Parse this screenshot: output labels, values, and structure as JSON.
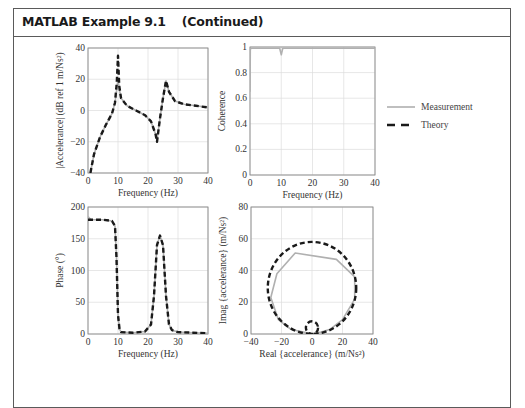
{
  "header": {
    "title": "MATLAB Example 9.1",
    "subtitle": "(Continued)"
  },
  "legend": {
    "items": [
      {
        "label": "Measurement",
        "style": "solid",
        "color": "#b0b0b0"
      },
      {
        "label": "Theory",
        "style": "dashed",
        "color": "#1a1a1a"
      }
    ]
  },
  "colors": {
    "measurement": "#b0b0b0",
    "theory": "#1a1a1a",
    "grid": "#dcdcdc",
    "axis": "#888888"
  },
  "chart_data": [
    {
      "id": "accelerance-magnitude",
      "type": "line",
      "title": "",
      "xlabel": "Frequency (Hz)",
      "ylabel": "|Accelerance| (dB ref 1 m/Ns²)",
      "xlim": [
        0,
        40
      ],
      "ylim": [
        -40,
        40
      ],
      "xticks": [
        "0",
        "10",
        "20",
        "30",
        "40"
      ],
      "yticks": [
        "-40",
        "-20",
        "0",
        "20",
        "40"
      ],
      "grid": true,
      "series": [
        {
          "name": "Measurement",
          "x": [
            0.8,
            2,
            4,
            6,
            8,
            9,
            9.6,
            10,
            10.4,
            11,
            13,
            16,
            19,
            21,
            22.5,
            23,
            24,
            25,
            26,
            27,
            29,
            32,
            36,
            40
          ],
          "y": [
            -40,
            -28,
            -17,
            -9,
            -2,
            5,
            14,
            20,
            14,
            8,
            3,
            0,
            -3,
            -7,
            -15,
            -19,
            -5,
            8,
            19,
            12,
            6,
            4,
            3,
            2
          ]
        },
        {
          "name": "Theory",
          "x": [
            0.8,
            2,
            4,
            6,
            8,
            9,
            9.6,
            10,
            10.4,
            11,
            13,
            16,
            19,
            21,
            22.5,
            23,
            24,
            25,
            26,
            27,
            29,
            32,
            36,
            40
          ],
          "y": [
            -40,
            -28,
            -17,
            -9,
            -2,
            5,
            18,
            35,
            16,
            8,
            3,
            0,
            -3,
            -7,
            -15,
            -20,
            -5,
            8,
            19,
            12,
            6,
            4,
            3,
            2
          ]
        }
      ]
    },
    {
      "id": "coherence",
      "type": "line",
      "title": "",
      "xlabel": "Frequency (Hz)",
      "ylabel": "Coherence",
      "xlim": [
        0,
        40
      ],
      "ylim": [
        0,
        1
      ],
      "xticks": [
        "0",
        "10",
        "20",
        "30",
        "40"
      ],
      "yticks": [
        "0",
        "0.2",
        "0.4",
        "0.6",
        "0.8",
        "1"
      ],
      "grid": true,
      "series": [
        {
          "name": "Measurement",
          "x": [
            0,
            0.1,
            0.3,
            2,
            9.5,
            9.8,
            10,
            10.2,
            10.5,
            40
          ],
          "y": [
            0.65,
            0.98,
            0.99,
            0.99,
            0.99,
            0.96,
            0.94,
            0.96,
            0.99,
            0.99
          ]
        }
      ]
    },
    {
      "id": "phase",
      "type": "line",
      "title": "",
      "xlabel": "Frequency (Hz)",
      "ylabel": "Phase (°)",
      "xlim": [
        0,
        40
      ],
      "ylim": [
        0,
        200
      ],
      "xticks": [
        "0",
        "10",
        "20",
        "30",
        "40"
      ],
      "yticks": [
        "0",
        "50",
        "100",
        "150",
        "200"
      ],
      "grid": true,
      "series": [
        {
          "name": "Measurement",
          "x": [
            0,
            1,
            5,
            8,
            9,
            9.5,
            10,
            10.5,
            11,
            15,
            19,
            21,
            22,
            23,
            24,
            25,
            26,
            27,
            28,
            30,
            35,
            40
          ],
          "y": [
            185,
            180,
            180,
            178,
            170,
            120,
            30,
            8,
            3,
            2,
            4,
            15,
            60,
            140,
            155,
            140,
            60,
            15,
            6,
            3,
            2,
            1
          ]
        },
        {
          "name": "Theory",
          "x": [
            0,
            1,
            5,
            8,
            9,
            9.5,
            10,
            10.5,
            11,
            15,
            19,
            21,
            22,
            23,
            24,
            25,
            26,
            27,
            28,
            30,
            35,
            40
          ],
          "y": [
            180,
            180,
            180,
            178,
            170,
            120,
            30,
            8,
            3,
            2,
            4,
            15,
            60,
            140,
            155,
            140,
            60,
            15,
            6,
            3,
            2,
            1
          ]
        }
      ]
    },
    {
      "id": "nyquist",
      "type": "line",
      "title": "",
      "xlabel": "Real {accelerance} (m/Ns²)",
      "ylabel": "Imag {accelerance} (m/Ns²)",
      "xlim": [
        -40,
        40
      ],
      "ylim": [
        0,
        80
      ],
      "xticks": [
        "-40",
        "-20",
        "0",
        "20",
        "40"
      ],
      "yticks": [
        "0",
        "20",
        "40",
        "60",
        "80"
      ],
      "grid": true,
      "series": [
        {
          "name": "Measurement",
          "x": [
            0,
            5,
            12,
            20,
            28,
            28,
            16,
            -11,
            -23,
            -27,
            -22,
            -14,
            -5,
            0
          ],
          "y": [
            0,
            1,
            3,
            9,
            22,
            36,
            47,
            51,
            38,
            23,
            9,
            3,
            1,
            0
          ]
        },
        {
          "name": "Theory",
          "circle": {
            "cx": 0,
            "cy": 29,
            "r": 29
          }
        },
        {
          "name": "Theory-small-loop",
          "circle": {
            "cx": 0,
            "cy": 4,
            "r": 4
          }
        }
      ]
    }
  ]
}
